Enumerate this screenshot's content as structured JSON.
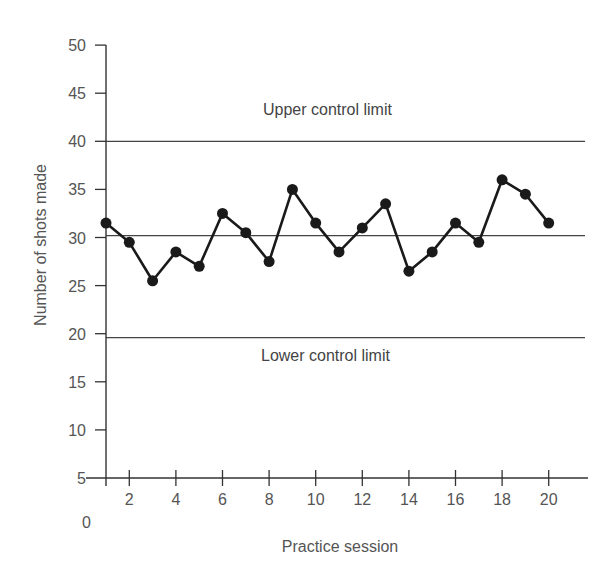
{
  "chart_data": {
    "type": "line",
    "title": "",
    "xlabel": "Practice session",
    "ylabel": "Number of shots made",
    "x": [
      1,
      2,
      3,
      4,
      5,
      6,
      7,
      8,
      9,
      10,
      11,
      12,
      13,
      14,
      15,
      16,
      17,
      18,
      19,
      20
    ],
    "series": [
      {
        "name": "Shots made",
        "values": [
          31.5,
          29.5,
          25.5,
          28.5,
          27,
          32.5,
          30.5,
          27.5,
          35,
          31.5,
          28.5,
          31,
          33.5,
          26.5,
          28.5,
          31.5,
          29.5,
          36,
          34.5,
          31.5
        ],
        "color": "#1a1a1a",
        "marker": "filled-circle"
      }
    ],
    "reference_lines": [
      {
        "name": "Upper control limit",
        "y": 40,
        "label": "Upper control limit"
      },
      {
        "name": "Center line",
        "y": 30.2,
        "label": ""
      },
      {
        "name": "Lower control limit",
        "y": 19.6,
        "label": "Lower control limit"
      }
    ],
    "xticks": [
      2,
      4,
      6,
      8,
      10,
      12,
      14,
      16,
      18,
      20
    ],
    "xtick_labels": [
      "2",
      "4",
      "6",
      "8",
      "10",
      "12",
      "14",
      "16",
      "18",
      "20"
    ],
    "yticks": [
      5,
      10,
      15,
      20,
      25,
      30,
      35,
      40,
      45,
      50
    ],
    "ytick_labels": [
      "5",
      "10",
      "15",
      "20",
      "25",
      "30",
      "35",
      "40",
      "45",
      "50"
    ],
    "y_origin_label": "0",
    "ylim": [
      5,
      50
    ],
    "xlim": [
      1,
      22
    ],
    "grid": false,
    "legend": "none"
  },
  "labels": {
    "ucl": "Upper control limit",
    "lcl": "Lower control limit",
    "xlabel": "Practice session",
    "ylabel": "Number of shots made",
    "origin": "0"
  }
}
